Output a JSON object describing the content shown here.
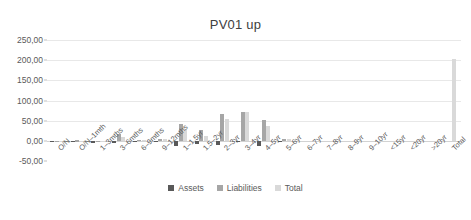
{
  "chart_data": {
    "type": "bar",
    "title": "PV01 up",
    "xlabel": "",
    "ylabel": "",
    "ylim": [
      -50,
      250
    ],
    "yticks": [
      "-50,00",
      "0,00",
      "50,00",
      "100,00",
      "150,00",
      "200,00",
      "250,00"
    ],
    "ytick_values": [
      -50,
      0,
      50,
      100,
      150,
      200,
      250
    ],
    "grid": true,
    "legend_position": "bottom",
    "decimal_separator": ",",
    "categories": [
      "O/N",
      "O/N–1mth",
      "1–3mths",
      "3–6mths",
      "6–9mths",
      "9–12mths",
      "1–1.5yr",
      "1.5–2yr",
      "2–3yr",
      "3–4yr",
      "4–5yr",
      "5–6yr",
      "6–7yr",
      "7–8yr",
      "8–9yr",
      "9–10yr",
      "<15yr",
      "<20yr",
      ">20yr",
      "Total"
    ],
    "series": [
      {
        "name": "Assets",
        "color": "#595959",
        "values": [
          -0.5,
          -2.0,
          -4.0,
          -6.0,
          -1.5,
          -2.0,
          -13.0,
          -7.0,
          -11.0,
          -2.0,
          -12.0,
          -2.0,
          0,
          0,
          0,
          0,
          0,
          0,
          0,
          0
        ]
      },
      {
        "name": "Liabilities",
        "color": "#a6a6a6",
        "values": [
          0.5,
          1.5,
          1.0,
          18.0,
          3.0,
          6.0,
          43.0,
          26.0,
          68.0,
          73.0,
          52.0,
          4.0,
          0,
          0,
          0,
          0,
          0,
          0,
          0,
          0
        ]
      },
      {
        "name": "Total",
        "color": "#d9d9d9",
        "values": [
          0.3,
          0.5,
          0.5,
          9.0,
          2.0,
          4.0,
          26.0,
          12.0,
          54.0,
          71.0,
          38.0,
          5.0,
          0,
          0,
          0,
          0,
          0,
          0,
          0,
          202.0
        ]
      }
    ]
  },
  "legend": {
    "items": [
      {
        "label": "Assets"
      },
      {
        "label": "Liabilities"
      },
      {
        "label": "Total"
      }
    ]
  }
}
